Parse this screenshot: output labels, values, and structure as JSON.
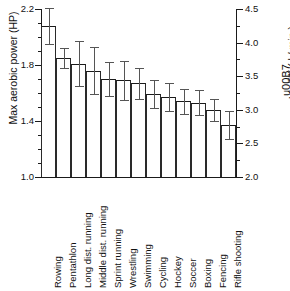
{
  "chart_data": {
    "type": "bar",
    "title": "",
    "subtitle": "",
    "ylabel": "Max aerobic power (HP)",
    "ylabel_right": "VO2 max ( l / min )",
    "xlabel": "",
    "ylim": [
      1.0,
      2.2
    ],
    "ylim_right": [
      2.0,
      4.5
    ],
    "grid": false,
    "legend": false,
    "orientation": "vertical",
    "error_bars": "symmetric",
    "categories": [
      "Rowing",
      "Pentathlon",
      "Long dist. running",
      "Middle dist. running",
      "Sprint running",
      "Wrestling",
      "Swimming",
      "Cycling",
      "Hockey",
      "Soccer",
      "Boxing",
      "Fencing",
      "Rifle shooting"
    ],
    "values": [
      2.08,
      1.85,
      1.81,
      1.76,
      1.7,
      1.69,
      1.67,
      1.59,
      1.57,
      1.54,
      1.53,
      1.48,
      1.37
    ],
    "errors": [
      0.13,
      0.07,
      0.16,
      0.17,
      0.12,
      0.14,
      0.11,
      0.1,
      0.1,
      0.09,
      0.09,
      0.08,
      0.1
    ],
    "yticks_left": [
      "1.0",
      "1.4",
      "1.8",
      "2.2"
    ],
    "ytick_values_left": [
      1.0,
      1.4,
      1.8,
      2.2
    ],
    "yminor_left": [
      1.1,
      1.2,
      1.3,
      1.5,
      1.6,
      1.7,
      1.9,
      2.0,
      2.1
    ],
    "yticks_right": [
      "2.0",
      "2.5",
      "3.0",
      "3.5",
      "4.0",
      "4.5"
    ],
    "ytick_values_right": [
      2.0,
      2.5,
      3.0,
      3.5,
      4.0,
      4.5
    ],
    "yminor_right": [
      2.25,
      2.75,
      3.25,
      3.75,
      4.25
    ],
    "colors": {
      "bar_fill": "#ffffff",
      "bar_outline": "#1a1a1a",
      "error_bar": "#555555",
      "axis": "#1a1a1a",
      "text": "#111111",
      "background": "#ffffff"
    }
  }
}
